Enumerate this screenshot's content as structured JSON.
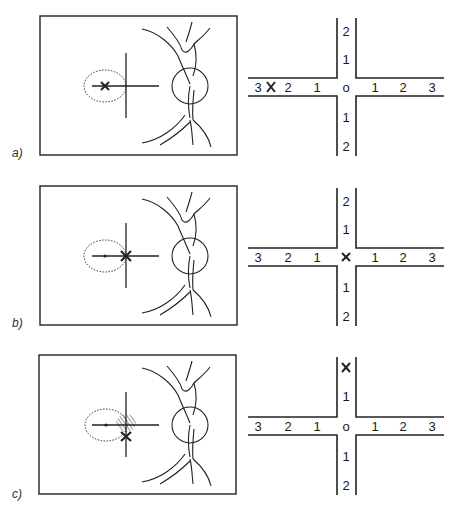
{
  "panels": [
    {
      "id": "a",
      "label": "a)",
      "fundus": {
        "fixation_mark": "x-at-fovea",
        "hatched_region": false
      },
      "grid": {
        "horizontal_left": [
          "3",
          "2",
          "1"
        ],
        "horizontal_right": [
          "1",
          "2",
          "3"
        ],
        "vertical_top": [
          "2",
          "1"
        ],
        "vertical_bottom": [
          "1",
          "2"
        ],
        "center": "o",
        "marker": "x",
        "marker_position": "between left 3 and 2"
      }
    },
    {
      "id": "b",
      "label": "b)",
      "fundus": {
        "fixation_mark": "x-at-cross-center",
        "hatched_region": false
      },
      "grid": {
        "horizontal_left": [
          "3",
          "2",
          "1"
        ],
        "horizontal_right": [
          "1",
          "2",
          "3"
        ],
        "vertical_top": [
          "2",
          "1"
        ],
        "vertical_bottom": [
          "1",
          "2"
        ],
        "center": "x",
        "marker": "x",
        "marker_position": "center"
      }
    },
    {
      "id": "c",
      "label": "c)",
      "fundus": {
        "fixation_mark": "x-below-cross-center",
        "hatched_region": true
      },
      "grid": {
        "horizontal_left": [
          "3",
          "2",
          "1"
        ],
        "horizontal_right": [
          "1",
          "2",
          "3"
        ],
        "vertical_top": [
          "x",
          "1"
        ],
        "vertical_bottom": [
          "1",
          "2"
        ],
        "center": "o",
        "marker": "x",
        "marker_position": "top 2 replaced"
      }
    }
  ]
}
